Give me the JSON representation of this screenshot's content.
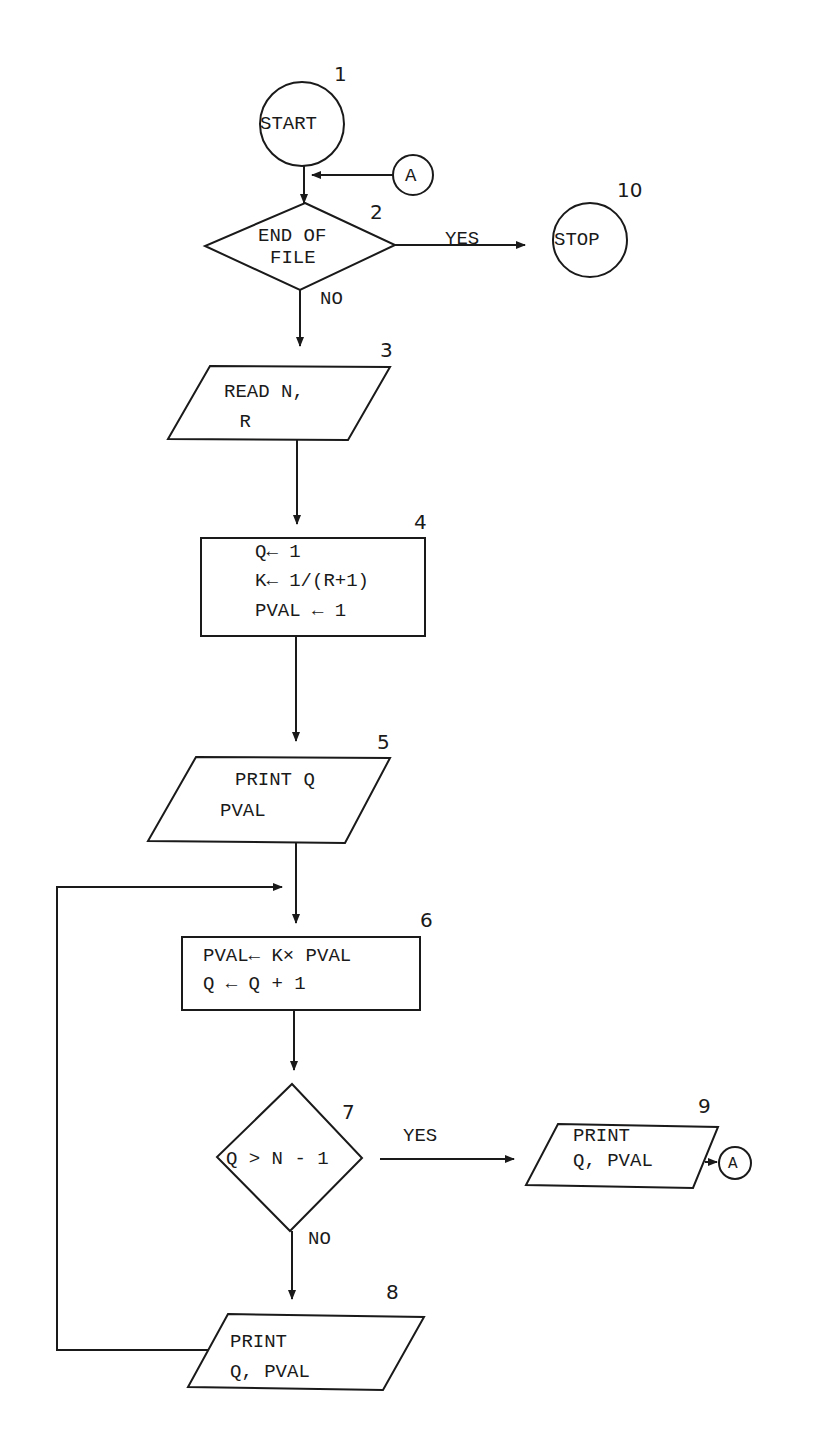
{
  "flowchart": {
    "nodes": [
      {
        "id": 1,
        "number": "1",
        "type": "terminal",
        "lines": [
          "START"
        ]
      },
      {
        "id": 2,
        "number": "2",
        "type": "decision",
        "lines": [
          "END OF",
          "FILE"
        ]
      },
      {
        "id": 3,
        "number": "3",
        "type": "io",
        "lines": [
          "READ N,",
          " R"
        ]
      },
      {
        "id": 4,
        "number": "4",
        "type": "process",
        "lines": [
          "Q← 1",
          "K← 1/(R+1)",
          "PVAL ← 1"
        ]
      },
      {
        "id": 5,
        "number": "5",
        "type": "io",
        "lines": [
          "PRINT Q",
          "PVAL"
        ]
      },
      {
        "id": 6,
        "number": "6",
        "type": "process",
        "lines": [
          "PVAL← K× PVAL",
          "Q ← Q + 1"
        ]
      },
      {
        "id": 7,
        "number": "7",
        "type": "decision",
        "lines": [
          "Q > N - 1"
        ]
      },
      {
        "id": 8,
        "number": "8",
        "type": "io",
        "lines": [
          "PRINT",
          "Q, PVAL"
        ]
      },
      {
        "id": 9,
        "number": "9",
        "type": "io",
        "lines": [
          "PRINT",
          "Q, PVAL"
        ]
      },
      {
        "id": 10,
        "number": "10",
        "type": "terminal",
        "lines": [
          "STOP"
        ]
      }
    ],
    "connectors": [
      {
        "id": "A-in",
        "label": "A"
      },
      {
        "id": "A-out",
        "label": "A"
      }
    ],
    "edge_labels": {
      "d2_yes": "YES",
      "d2_no": "NO",
      "d7_yes": "YES",
      "d7_no": "NO"
    },
    "edges": [
      {
        "from": 1,
        "to": 2
      },
      {
        "from": "A-in",
        "to": 2
      },
      {
        "from": 2,
        "to": 10,
        "label": "YES"
      },
      {
        "from": 2,
        "to": 3,
        "label": "NO"
      },
      {
        "from": 3,
        "to": 4
      },
      {
        "from": 4,
        "to": 5
      },
      {
        "from": 5,
        "to": 6
      },
      {
        "from": 6,
        "to": 7
      },
      {
        "from": 7,
        "to": 9,
        "label": "YES"
      },
      {
        "from": 7,
        "to": 8,
        "label": "NO"
      },
      {
        "from": 9,
        "to": "A-out"
      },
      {
        "from": 8,
        "to": 6
      }
    ],
    "stroke_color": "#1a1a1a",
    "background_color": "#ffffff"
  }
}
